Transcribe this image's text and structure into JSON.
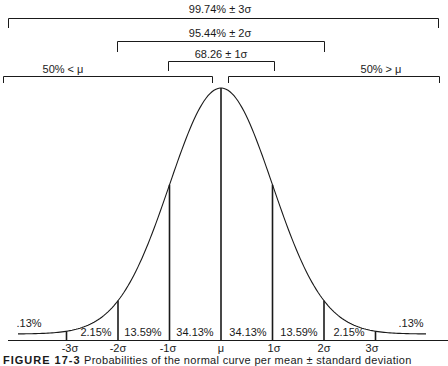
{
  "chart_data": {
    "type": "area",
    "xlabel": "",
    "ylabel": "",
    "x_ticks": [
      "-3σ",
      "-2σ",
      "-1σ",
      "μ",
      "1σ",
      "2σ",
      "3σ"
    ],
    "x_values": [
      -3,
      -2,
      -1,
      0,
      1,
      2,
      3
    ],
    "segments": [
      {
        "range": "< -3σ",
        "label": ".13%",
        "value": 0.13
      },
      {
        "range": "-3σ to -2σ",
        "label": "2.15%",
        "value": 2.15
      },
      {
        "range": "-2σ to -1σ",
        "label": "13.59%",
        "value": 13.59
      },
      {
        "range": "-1σ to μ",
        "label": "34.13%",
        "value": 34.13
      },
      {
        "range": "μ to 1σ",
        "label": "34.13%",
        "value": 34.13
      },
      {
        "range": "1σ to 2σ",
        "label": "13.59%",
        "value": 13.59
      },
      {
        "range": "2σ to 3σ",
        "label": "2.15%",
        "value": 2.15
      },
      {
        "range": "> 3σ",
        "label": ".13%",
        "value": 0.13
      }
    ],
    "brackets": [
      {
        "label": "99.74% ± 3σ",
        "from": -3,
        "to": 3,
        "value": 99.74
      },
      {
        "label": "95.44% ± 2σ",
        "from": -2,
        "to": 2,
        "value": 95.44
      },
      {
        "label": "68.26 ± 1σ",
        "from": -1,
        "to": 1,
        "value": 68.26
      },
      {
        "label": "50% < μ",
        "from": "-inf",
        "to": 0,
        "value": 50
      },
      {
        "label": "50% > μ",
        "from": 0,
        "to": "inf",
        "value": 50
      }
    ],
    "grid": false,
    "legend": "none"
  },
  "labels": {
    "bracket_3s": "99.74% ± 3σ",
    "bracket_2s": "95.44% ± 2σ",
    "bracket_1s": "68.26 ± 1σ",
    "left_half": "50% < μ",
    "right_half": "50% > μ",
    "tail_left": ".13%",
    "tail_right": ".13%",
    "seg_m3_m2": "2.15%",
    "seg_m2_m1": "13.59%",
    "seg_m1_0": "34.13%",
    "seg_0_1": "34.13%",
    "seg_1_2": "13.59%",
    "seg_2_3": "2.15%",
    "tick_m3": "-3σ",
    "tick_m2": "-2σ",
    "tick_m1": "-1σ",
    "tick_0": "μ",
    "tick_1": "1σ",
    "tick_2": "2σ",
    "tick_3": "3σ"
  },
  "caption": {
    "figure": "FIGURE 17-3",
    "text": "Probabilities of the normal curve per mean ± standard deviation"
  },
  "colors": {
    "ink": "#1a1a1a",
    "background": "#ffffff"
  }
}
